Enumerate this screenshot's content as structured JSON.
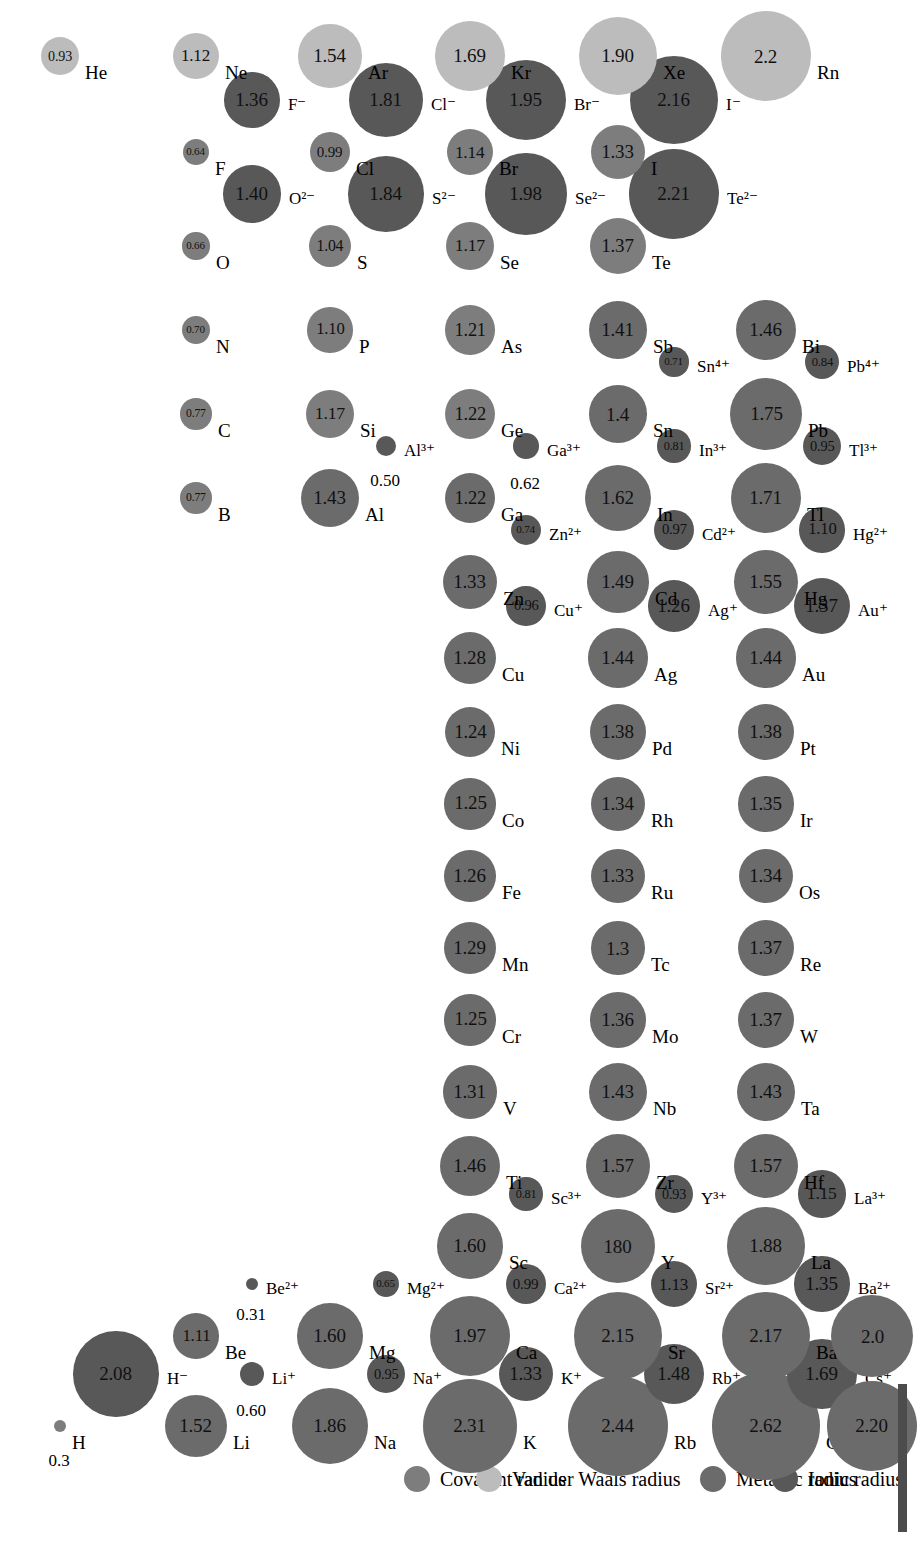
{
  "figure": {
    "units": "angstrom"
  },
  "legend": {
    "items": [
      {
        "label": "Metallic radius",
        "color": "#6b6b6b",
        "kind": "metallic"
      },
      {
        "label": "Ionic radius",
        "color": "#585858",
        "kind": "ionic"
      },
      {
        "label": "Covalent radius",
        "color": "#7d7d7d",
        "kind": "covalent"
      },
      {
        "label": "Van der Waals radius",
        "color": "#bcbcbc",
        "kind": "vdw"
      }
    ]
  },
  "colors": {
    "metallic": "#6b6b6b",
    "ionic": "#585858",
    "covalent": "#7d7d7d",
    "vdw": "#bcbcbc",
    "rule": "#4c4c4c",
    "text": "#000000",
    "background": "#ffffff"
  },
  "chart_data": {
    "type": "scatter",
    "xlabel": "Group",
    "ylabel": "Period",
    "value_unit": "angstrom",
    "encoding": "circle area/diameter proportional to radius; fill colour encodes radius type",
    "series": [
      {
        "name": "Metallic radius",
        "color": "#6b6b6b"
      },
      {
        "name": "Ionic radius",
        "color": "#585858"
      },
      {
        "name": "Covalent radius",
        "color": "#7d7d7d"
      },
      {
        "name": "Van der Waals radius",
        "color": "#bcbcbc"
      }
    ],
    "points": [
      {
        "symbol": "H",
        "value": "0.3",
        "r": 0.3,
        "kind": "covalent",
        "col": 1,
        "row": 1,
        "slot": "main"
      },
      {
        "symbol": "H⁻",
        "value": "2.08",
        "r": 2.08,
        "kind": "ionic",
        "col": 1,
        "row": 1,
        "slot": "ion"
      },
      {
        "symbol": "He",
        "value": "0.93",
        "r": 0.93,
        "kind": "vdw",
        "col": 18,
        "row": 1,
        "slot": "main"
      },
      {
        "symbol": "Li",
        "value": "1.52",
        "r": 1.52,
        "kind": "metallic",
        "col": 1,
        "row": 2,
        "slot": "main"
      },
      {
        "symbol": "Li⁺",
        "value": "0.60",
        "r": 0.6,
        "kind": "ionic",
        "col": 1,
        "row": 2,
        "slot": "ion"
      },
      {
        "symbol": "Be",
        "value": "1.11",
        "r": 1.11,
        "kind": "metallic",
        "col": 2,
        "row": 2,
        "slot": "main"
      },
      {
        "symbol": "Be²⁺",
        "value": "0.31",
        "r": 0.31,
        "kind": "ionic",
        "col": 2,
        "row": 2,
        "slot": "ion"
      },
      {
        "symbol": "B",
        "value": "0.77",
        "r": 0.77,
        "kind": "covalent",
        "col": 13,
        "row": 2,
        "slot": "main"
      },
      {
        "symbol": "C",
        "value": "0.77",
        "r": 0.77,
        "kind": "covalent",
        "col": 14,
        "row": 2,
        "slot": "main"
      },
      {
        "symbol": "N",
        "value": "0.70",
        "r": 0.7,
        "kind": "covalent",
        "col": 15,
        "row": 2,
        "slot": "main"
      },
      {
        "symbol": "O",
        "value": "0.66",
        "r": 0.66,
        "kind": "covalent",
        "col": 16,
        "row": 2,
        "slot": "main"
      },
      {
        "symbol": "O²⁻",
        "value": "1.40",
        "r": 1.4,
        "kind": "ionic",
        "col": 16,
        "row": 2,
        "slot": "ion"
      },
      {
        "symbol": "F",
        "value": "0.64",
        "r": 0.64,
        "kind": "covalent",
        "col": 17,
        "row": 2,
        "slot": "main"
      },
      {
        "symbol": "F⁻",
        "value": "1.36",
        "r": 1.36,
        "kind": "ionic",
        "col": 17,
        "row": 2,
        "slot": "ion"
      },
      {
        "symbol": "Ne",
        "value": "1.12",
        "r": 1.12,
        "kind": "vdw",
        "col": 18,
        "row": 2,
        "slot": "main"
      },
      {
        "symbol": "Na",
        "value": "1.86",
        "r": 1.86,
        "kind": "metallic",
        "col": 1,
        "row": 3,
        "slot": "main"
      },
      {
        "symbol": "Na⁺",
        "value": "0.95",
        "r": 0.95,
        "kind": "ionic",
        "col": 1,
        "row": 3,
        "slot": "ion"
      },
      {
        "symbol": "Mg",
        "value": "1.60",
        "r": 1.6,
        "kind": "metallic",
        "col": 2,
        "row": 3,
        "slot": "main"
      },
      {
        "symbol": "Mg²⁺",
        "value": "0.65",
        "r": 0.65,
        "kind": "ionic",
        "col": 2,
        "row": 3,
        "slot": "ion"
      },
      {
        "symbol": "Al",
        "value": "1.43",
        "r": 1.43,
        "kind": "metallic",
        "col": 13,
        "row": 3,
        "slot": "main"
      },
      {
        "symbol": "Al³⁺",
        "value": "0.50",
        "r": 0.5,
        "kind": "ionic",
        "col": 13,
        "row": 3,
        "slot": "ion"
      },
      {
        "symbol": "Si",
        "value": "1.17",
        "r": 1.17,
        "kind": "covalent",
        "col": 14,
        "row": 3,
        "slot": "main"
      },
      {
        "symbol": "P",
        "value": "1.10",
        "r": 1.1,
        "kind": "covalent",
        "col": 15,
        "row": 3,
        "slot": "main"
      },
      {
        "symbol": "S",
        "value": "1.04",
        "r": 1.04,
        "kind": "covalent",
        "col": 16,
        "row": 3,
        "slot": "main"
      },
      {
        "symbol": "S²⁻",
        "value": "1.84",
        "r": 1.84,
        "kind": "ionic",
        "col": 16,
        "row": 3,
        "slot": "ion"
      },
      {
        "symbol": "Cl",
        "value": "0.99",
        "r": 0.99,
        "kind": "covalent",
        "col": 17,
        "row": 3,
        "slot": "main"
      },
      {
        "symbol": "Cl⁻",
        "value": "1.81",
        "r": 1.81,
        "kind": "ionic",
        "col": 17,
        "row": 3,
        "slot": "ion"
      },
      {
        "symbol": "Ar",
        "value": "1.54",
        "r": 1.54,
        "kind": "vdw",
        "col": 18,
        "row": 3,
        "slot": "main"
      },
      {
        "symbol": "K",
        "value": "2.31",
        "r": 2.31,
        "kind": "metallic",
        "col": 1,
        "row": 4,
        "slot": "main"
      },
      {
        "symbol": "K⁺",
        "value": "1.33",
        "r": 1.33,
        "kind": "ionic",
        "col": 1,
        "row": 4,
        "slot": "ion"
      },
      {
        "symbol": "Ca",
        "value": "1.97",
        "r": 1.97,
        "kind": "metallic",
        "col": 2,
        "row": 4,
        "slot": "main"
      },
      {
        "symbol": "Ca²⁺",
        "value": "0.99",
        "r": 0.99,
        "kind": "ionic",
        "col": 2,
        "row": 4,
        "slot": "ion"
      },
      {
        "symbol": "Sc",
        "value": "1.60",
        "r": 1.6,
        "kind": "metallic",
        "col": 3,
        "row": 4,
        "slot": "main"
      },
      {
        "symbol": "Sc³⁺",
        "value": "0.81",
        "r": 0.81,
        "kind": "ionic",
        "col": 3,
        "row": 4,
        "slot": "ion"
      },
      {
        "symbol": "Ti",
        "value": "1.46",
        "r": 1.46,
        "kind": "metallic",
        "col": 4,
        "row": 4,
        "slot": "main"
      },
      {
        "symbol": "V",
        "value": "1.31",
        "r": 1.31,
        "kind": "metallic",
        "col": 5,
        "row": 4,
        "slot": "main"
      },
      {
        "symbol": "Cr",
        "value": "1.25",
        "r": 1.25,
        "kind": "metallic",
        "col": 6,
        "row": 4,
        "slot": "main"
      },
      {
        "symbol": "Mn",
        "value": "1.29",
        "r": 1.29,
        "kind": "metallic",
        "col": 7,
        "row": 4,
        "slot": "main"
      },
      {
        "symbol": "Fe",
        "value": "1.26",
        "r": 1.26,
        "kind": "metallic",
        "col": 8,
        "row": 4,
        "slot": "main"
      },
      {
        "symbol": "Co",
        "value": "1.25",
        "r": 1.25,
        "kind": "metallic",
        "col": 9,
        "row": 4,
        "slot": "main"
      },
      {
        "symbol": "Ni",
        "value": "1.24",
        "r": 1.24,
        "kind": "metallic",
        "col": 10,
        "row": 4,
        "slot": "main"
      },
      {
        "symbol": "Cu",
        "value": "1.28",
        "r": 1.28,
        "kind": "metallic",
        "col": 11,
        "row": 4,
        "slot": "main"
      },
      {
        "symbol": "Cu⁺",
        "value": "0.96",
        "r": 0.96,
        "kind": "ionic",
        "col": 11,
        "row": 4,
        "slot": "ion"
      },
      {
        "symbol": "Zn",
        "value": "1.33",
        "r": 1.33,
        "kind": "metallic",
        "col": 12,
        "row": 4,
        "slot": "main"
      },
      {
        "symbol": "Zn²⁺",
        "value": "0.74",
        "r": 0.74,
        "kind": "ionic",
        "col": 12,
        "row": 4,
        "slot": "ion"
      },
      {
        "symbol": "Ga",
        "value": "1.22",
        "r": 1.22,
        "kind": "metallic",
        "col": 13,
        "row": 4,
        "slot": "main"
      },
      {
        "symbol": "Ga³⁺",
        "value": "0.62",
        "r": 0.62,
        "kind": "ionic",
        "col": 13,
        "row": 4,
        "slot": "ion"
      },
      {
        "symbol": "Ge",
        "value": "1.22",
        "r": 1.22,
        "kind": "covalent",
        "col": 14,
        "row": 4,
        "slot": "main"
      },
      {
        "symbol": "As",
        "value": "1.21",
        "r": 1.21,
        "kind": "covalent",
        "col": 15,
        "row": 4,
        "slot": "main"
      },
      {
        "symbol": "Se",
        "value": "1.17",
        "r": 1.17,
        "kind": "covalent",
        "col": 16,
        "row": 4,
        "slot": "main"
      },
      {
        "symbol": "Se²⁻",
        "value": "1.98",
        "r": 1.98,
        "kind": "ionic",
        "col": 16,
        "row": 4,
        "slot": "ion"
      },
      {
        "symbol": "Br",
        "value": "1.14",
        "r": 1.14,
        "kind": "covalent",
        "col": 17,
        "row": 4,
        "slot": "main"
      },
      {
        "symbol": "Br⁻",
        "value": "1.95",
        "r": 1.95,
        "kind": "ionic",
        "col": 17,
        "row": 4,
        "slot": "ion"
      },
      {
        "symbol": "Kr",
        "value": "1.69",
        "r": 1.69,
        "kind": "vdw",
        "col": 18,
        "row": 4,
        "slot": "main"
      },
      {
        "symbol": "Rb",
        "value": "2.44",
        "r": 2.44,
        "kind": "metallic",
        "col": 1,
        "row": 5,
        "slot": "main"
      },
      {
        "symbol": "Rb⁺",
        "value": "1.48",
        "r": 1.48,
        "kind": "ionic",
        "col": 1,
        "row": 5,
        "slot": "ion"
      },
      {
        "symbol": "Sr",
        "value": "2.15",
        "r": 2.15,
        "kind": "metallic",
        "col": 2,
        "row": 5,
        "slot": "main"
      },
      {
        "symbol": "Sr²⁺",
        "value": "1.13",
        "r": 1.13,
        "kind": "ionic",
        "col": 2,
        "row": 5,
        "slot": "ion"
      },
      {
        "symbol": "Y",
        "value": "180",
        "r": 1.8,
        "kind": "metallic",
        "col": 3,
        "row": 5,
        "slot": "main"
      },
      {
        "symbol": "Y³⁺",
        "value": "0.93",
        "r": 0.93,
        "kind": "ionic",
        "col": 3,
        "row": 5,
        "slot": "ion"
      },
      {
        "symbol": "Zr",
        "value": "1.57",
        "r": 1.57,
        "kind": "metallic",
        "col": 4,
        "row": 5,
        "slot": "main"
      },
      {
        "symbol": "Nb",
        "value": "1.43",
        "r": 1.43,
        "kind": "metallic",
        "col": 5,
        "row": 5,
        "slot": "main"
      },
      {
        "symbol": "Mo",
        "value": "1.36",
        "r": 1.36,
        "kind": "metallic",
        "col": 6,
        "row": 5,
        "slot": "main"
      },
      {
        "symbol": "Tc",
        "value": "1.3",
        "r": 1.3,
        "kind": "metallic",
        "col": 7,
        "row": 5,
        "slot": "main"
      },
      {
        "symbol": "Ru",
        "value": "1.33",
        "r": 1.33,
        "kind": "metallic",
        "col": 8,
        "row": 5,
        "slot": "main"
      },
      {
        "symbol": "Rh",
        "value": "1.34",
        "r": 1.34,
        "kind": "metallic",
        "col": 9,
        "row": 5,
        "slot": "main"
      },
      {
        "symbol": "Pd",
        "value": "1.38",
        "r": 1.38,
        "kind": "metallic",
        "col": 10,
        "row": 5,
        "slot": "main"
      },
      {
        "symbol": "Ag",
        "value": "1.44",
        "r": 1.44,
        "kind": "metallic",
        "col": 11,
        "row": 5,
        "slot": "main"
      },
      {
        "symbol": "Ag⁺",
        "value": "1.26",
        "r": 1.26,
        "kind": "ionic",
        "col": 11,
        "row": 5,
        "slot": "ion"
      },
      {
        "symbol": "Cd",
        "value": "1.49",
        "r": 1.49,
        "kind": "metallic",
        "col": 12,
        "row": 5,
        "slot": "main"
      },
      {
        "symbol": "Cd²⁺",
        "value": "0.97",
        "r": 0.97,
        "kind": "ionic",
        "col": 12,
        "row": 5,
        "slot": "ion"
      },
      {
        "symbol": "In",
        "value": "1.62",
        "r": 1.62,
        "kind": "metallic",
        "col": 13,
        "row": 5,
        "slot": "main"
      },
      {
        "symbol": "In³⁺",
        "value": "0.81",
        "r": 0.81,
        "kind": "ionic",
        "col": 13,
        "row": 5,
        "slot": "ion"
      },
      {
        "symbol": "Sn",
        "value": "1.4",
        "r": 1.4,
        "kind": "metallic",
        "col": 14,
        "row": 5,
        "slot": "main"
      },
      {
        "symbol": "Sn⁴⁺",
        "value": "0.71",
        "r": 0.71,
        "kind": "ionic",
        "col": 14,
        "row": 5,
        "slot": "ion"
      },
      {
        "symbol": "Sb",
        "value": "1.41",
        "r": 1.41,
        "kind": "metallic",
        "col": 15,
        "row": 5,
        "slot": "main"
      },
      {
        "symbol": "Te",
        "value": "1.37",
        "r": 1.37,
        "kind": "covalent",
        "col": 16,
        "row": 5,
        "slot": "main"
      },
      {
        "symbol": "Te²⁻",
        "value": "2.21",
        "r": 2.21,
        "kind": "ionic",
        "col": 16,
        "row": 5,
        "slot": "ion"
      },
      {
        "symbol": "I",
        "value": "1.33",
        "r": 1.33,
        "kind": "covalent",
        "col": 17,
        "row": 5,
        "slot": "main"
      },
      {
        "symbol": "I⁻",
        "value": "2.16",
        "r": 2.16,
        "kind": "ionic",
        "col": 17,
        "row": 5,
        "slot": "ion"
      },
      {
        "symbol": "Xe",
        "value": "1.90",
        "r": 1.9,
        "kind": "vdw",
        "col": 18,
        "row": 5,
        "slot": "main"
      },
      {
        "symbol": "Cs",
        "value": "2.62",
        "r": 2.62,
        "kind": "metallic",
        "col": 1,
        "row": 6,
        "slot": "main"
      },
      {
        "symbol": "Cs⁺",
        "value": "1.69",
        "r": 1.69,
        "kind": "ionic",
        "col": 1,
        "row": 6,
        "slot": "ion"
      },
      {
        "symbol": "Ba",
        "value": "2.17",
        "r": 2.17,
        "kind": "metallic",
        "col": 2,
        "row": 6,
        "slot": "main"
      },
      {
        "symbol": "Ba²⁺",
        "value": "1.35",
        "r": 1.35,
        "kind": "ionic",
        "col": 2,
        "row": 6,
        "slot": "ion"
      },
      {
        "symbol": "La",
        "value": "1.88",
        "r": 1.88,
        "kind": "metallic",
        "col": 3,
        "row": 6,
        "slot": "main"
      },
      {
        "symbol": "La³⁺",
        "value": "1.15",
        "r": 1.15,
        "kind": "ionic",
        "col": 3,
        "row": 6,
        "slot": "ion"
      },
      {
        "symbol": "Hf",
        "value": "1.57",
        "r": 1.57,
        "kind": "metallic",
        "col": 4,
        "row": 6,
        "slot": "main"
      },
      {
        "symbol": "Ta",
        "value": "1.43",
        "r": 1.43,
        "kind": "metallic",
        "col": 5,
        "row": 6,
        "slot": "main"
      },
      {
        "symbol": "W",
        "value": "1.37",
        "r": 1.37,
        "kind": "metallic",
        "col": 6,
        "row": 6,
        "slot": "main"
      },
      {
        "symbol": "Re",
        "value": "1.37",
        "r": 1.37,
        "kind": "metallic",
        "col": 7,
        "row": 6,
        "slot": "main"
      },
      {
        "symbol": "Os",
        "value": "1.34",
        "r": 1.34,
        "kind": "metallic",
        "col": 8,
        "row": 6,
        "slot": "main"
      },
      {
        "symbol": "Ir",
        "value": "1.35",
        "r": 1.35,
        "kind": "metallic",
        "col": 9,
        "row": 6,
        "slot": "main"
      },
      {
        "symbol": "Pt",
        "value": "1.38",
        "r": 1.38,
        "kind": "metallic",
        "col": 10,
        "row": 6,
        "slot": "main"
      },
      {
        "symbol": "Au",
        "value": "1.44",
        "r": 1.44,
        "kind": "metallic",
        "col": 11,
        "row": 6,
        "slot": "main"
      },
      {
        "symbol": "Au⁺",
        "value": "1.37",
        "r": 1.37,
        "kind": "ionic",
        "col": 11,
        "row": 6,
        "slot": "ion"
      },
      {
        "symbol": "Hg",
        "value": "1.55",
        "r": 1.55,
        "kind": "metallic",
        "col": 12,
        "row": 6,
        "slot": "main"
      },
      {
        "symbol": "Hg²⁺",
        "value": "1.10",
        "r": 1.1,
        "kind": "ionic",
        "col": 12,
        "row": 6,
        "slot": "ion"
      },
      {
        "symbol": "Tl",
        "value": "1.71",
        "r": 1.71,
        "kind": "metallic",
        "col": 13,
        "row": 6,
        "slot": "main"
      },
      {
        "symbol": "Tl³⁺",
        "value": "0.95",
        "r": 0.95,
        "kind": "ionic",
        "col": 13,
        "row": 6,
        "slot": "ion"
      },
      {
        "symbol": "Pb",
        "value": "1.75",
        "r": 1.75,
        "kind": "metallic",
        "col": 14,
        "row": 6,
        "slot": "main"
      },
      {
        "symbol": "Pb⁴⁺",
        "value": "0.84",
        "r": 0.84,
        "kind": "ionic",
        "col": 14,
        "row": 6,
        "slot": "ion"
      },
      {
        "symbol": "Bi",
        "value": "1.46",
        "r": 1.46,
        "kind": "metallic",
        "col": 15,
        "row": 6,
        "slot": "main"
      },
      {
        "symbol": "Rn",
        "value": "2.2",
        "r": 2.2,
        "kind": "vdw",
        "col": 18,
        "row": 6,
        "slot": "main"
      },
      {
        "symbol": "Ra",
        "value": "2.20",
        "r": 2.2,
        "kind": "metallic",
        "col": 1,
        "row": 7,
        "slot": "main"
      },
      {
        "symbol": "Ac",
        "value": "2.0",
        "r": 2.0,
        "kind": "metallic",
        "col": 2,
        "row": 7,
        "slot": "main"
      }
    ]
  }
}
